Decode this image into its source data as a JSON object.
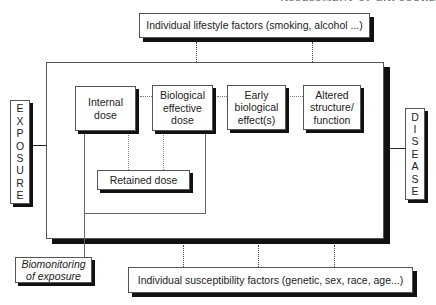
{
  "page_header": "ASSESSMENT OF EXPOSURE",
  "diagram": {
    "lifestyle_factors": "Individual lifestyle factors (smoking, alcohol ...)",
    "susceptibility_factors": "Individual susceptibility factors (genetic, sex, race, age...)",
    "exposure_label": [
      "E",
      "X",
      "P",
      "O",
      "S",
      "U",
      "R",
      "E"
    ],
    "disease_label": [
      "D",
      "I",
      "S",
      "E",
      "A",
      "S",
      "E"
    ],
    "stages": {
      "internal_dose": [
        "Internal",
        "dose"
      ],
      "biological_effective_dose": [
        "Biological",
        "effective",
        "dose"
      ],
      "early_biological_effect": [
        "Early",
        "biological",
        "effect(s)"
      ],
      "altered_structure": [
        "Altered",
        "structure/",
        "function"
      ]
    },
    "retained_dose": "Retained dose",
    "biomonitoring": [
      "Biomonitoring",
      "of exposure"
    ]
  }
}
